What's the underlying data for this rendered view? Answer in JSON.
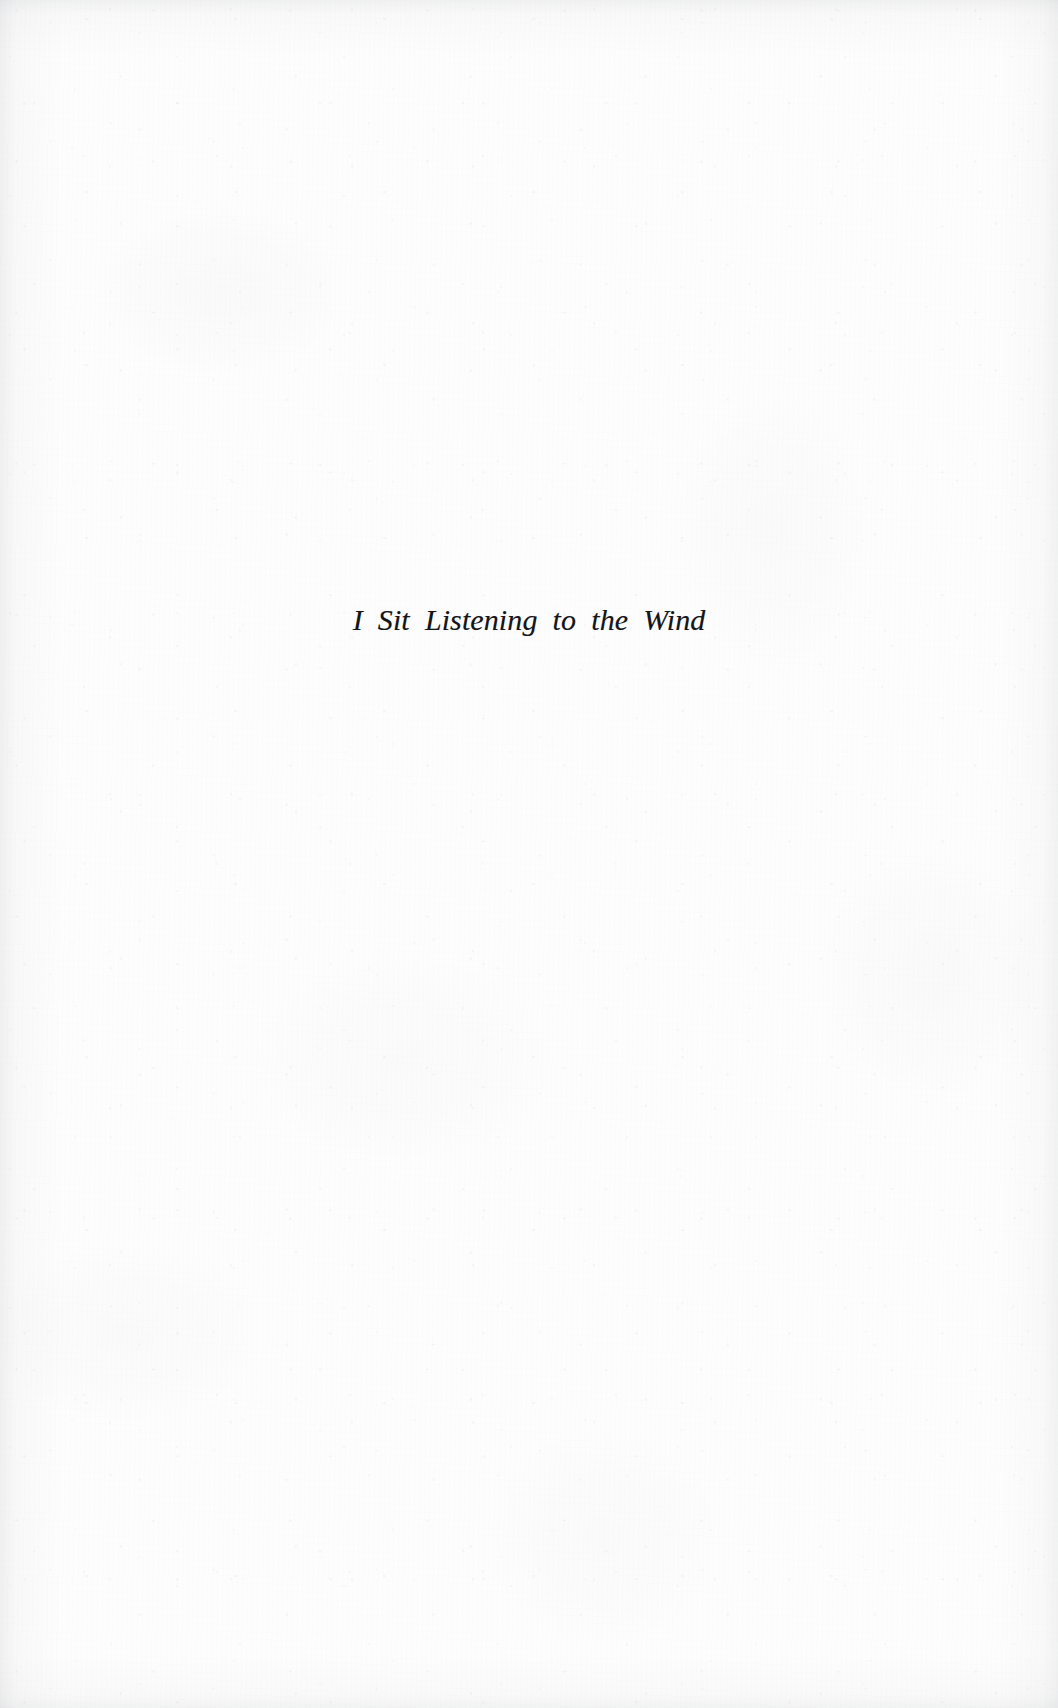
{
  "page": {
    "kind": "book-section-divider",
    "background_color": "#fdfdfd",
    "ink_color": "#15161a"
  },
  "content": {
    "section_title": "I Sit Listening to the Wind"
  }
}
